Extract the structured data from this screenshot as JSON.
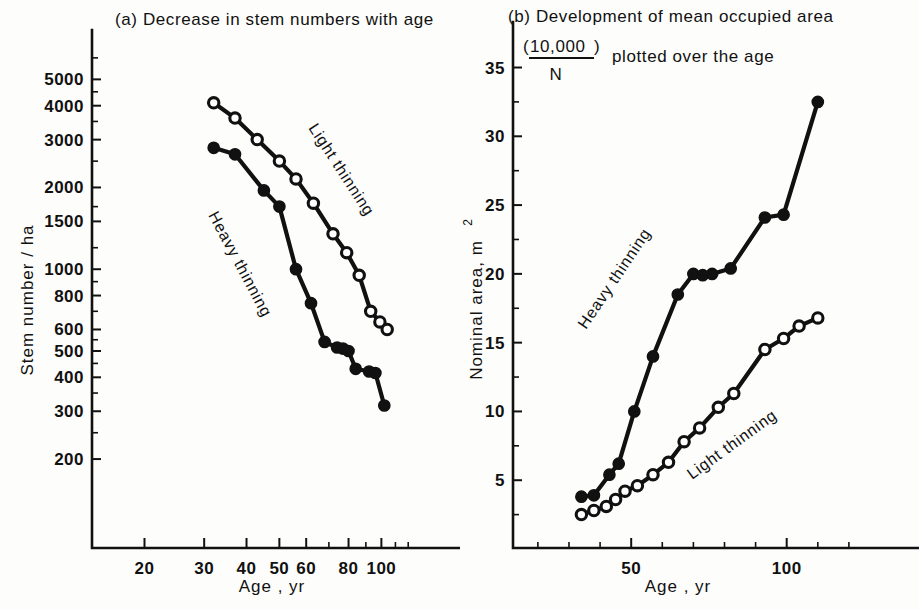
{
  "figure": {
    "background": "#fdfdfb",
    "ink": "#111111"
  },
  "panel_a": {
    "label": "(a)",
    "title": "(a)  Decrease in stem numbers with age",
    "title_text": "Decrease in stem numbers with age",
    "ylabel": "Stem number / ha",
    "xlabel": "Age ,  yr",
    "series_label_light": "Light thinning",
    "series_label_heavy": "Heavy thinning"
  },
  "panel_b": {
    "label": "(b)",
    "title_line1": "(b)  Development of mean occupied area",
    "title_line1_text": "Development of mean occupied area",
    "fraction_open": "(",
    "fraction_numerator": "10,000",
    "fraction_denominator": "N",
    "fraction_close": ")",
    "title_line2_tail": "plotted over the age",
    "ylabel_main": "Nominal area,  m",
    "ylabel_exponent": "2",
    "xlabel": "Age ,  yr",
    "series_label_heavy": "Heavy thinning",
    "series_label_light": "Light thinning"
  },
  "chart_data": [
    {
      "id": "panel-a",
      "type": "line",
      "title": "(a) Decrease in stem numbers with age",
      "xlabel": "Age, yr",
      "ylabel": "Stem number / ha",
      "xscale": "log",
      "yscale": "log",
      "xlim": [
        14,
        130
      ],
      "ylim": [
        150,
        6200
      ],
      "xticks": [
        20,
        30,
        40,
        50,
        60,
        80,
        100
      ],
      "xtick_labels": [
        "20",
        "30",
        "40",
        "50",
        "60",
        "80",
        "100"
      ],
      "yticks": [
        200,
        300,
        400,
        500,
        600,
        800,
        1000,
        1500,
        2000,
        3000,
        4000,
        5000
      ],
      "ytick_labels": [
        "200",
        "300",
        "400",
        "500",
        "600",
        "800",
        "1000",
        "1500",
        "2000",
        "3000",
        "4000",
        "5000"
      ],
      "grid": false,
      "legend": "inline-annotation",
      "series": [
        {
          "name": "Light thinning",
          "marker": "open-circle",
          "x": [
            32,
            37,
            43,
            50,
            56,
            63,
            72,
            79,
            86,
            93,
            99,
            104
          ],
          "y": [
            4100,
            3600,
            3000,
            2500,
            2150,
            1750,
            1350,
            1150,
            950,
            700,
            640,
            600
          ]
        },
        {
          "name": "Heavy thinning",
          "marker": "filled-circle",
          "x": [
            32,
            37,
            45,
            50,
            56,
            62,
            68,
            74,
            77,
            80,
            84,
            92,
            96,
            102
          ],
          "y": [
            2800,
            2650,
            1950,
            1700,
            1000,
            750,
            540,
            515,
            510,
            500,
            430,
            420,
            415,
            315
          ]
        }
      ]
    },
    {
      "id": "panel-b",
      "type": "line",
      "title": "(b) Development of mean occupied area (10,000/N) plotted over the age",
      "xlabel": "Age, yr",
      "ylabel": "Nominal area, m2",
      "xscale": "linear",
      "yscale": "linear",
      "xlim": [
        12,
        130
      ],
      "ylim": [
        0,
        37
      ],
      "xticks": [
        50,
        100
      ],
      "xtick_labels": [
        "50",
        "100"
      ],
      "xticks_minor": [
        20,
        30,
        40,
        60,
        70,
        80,
        90,
        110,
        120
      ],
      "yticks": [
        5,
        10,
        15,
        20,
        25,
        30,
        35
      ],
      "ytick_labels": [
        "5",
        "10",
        "15",
        "20",
        "25",
        "30",
        "35"
      ],
      "yticks_minor": [
        2.5,
        7.5,
        12.5,
        17.5,
        22.5,
        27.5,
        32.5
      ],
      "grid": false,
      "legend": "inline-annotation",
      "series": [
        {
          "name": "Heavy thinning",
          "marker": "filled-circle",
          "x": [
            34,
            38,
            43,
            46,
            51,
            57,
            65,
            70,
            73,
            76,
            82,
            93,
            99,
            110
          ],
          "y": [
            3.8,
            3.9,
            5.4,
            6.2,
            10.0,
            14.0,
            18.5,
            20.0,
            19.9,
            20.0,
            20.4,
            24.1,
            24.3,
            32.5
          ]
        },
        {
          "name": "Light thinning",
          "marker": "open-circle",
          "x": [
            34,
            38,
            42,
            45,
            48,
            52,
            57,
            62,
            67,
            72,
            78,
            83,
            93,
            99,
            104,
            110
          ],
          "y": [
            2.5,
            2.8,
            3.1,
            3.6,
            4.2,
            4.6,
            5.4,
            6.3,
            7.8,
            8.8,
            10.3,
            11.3,
            14.5,
            15.3,
            16.2,
            16.8
          ]
        }
      ]
    }
  ]
}
